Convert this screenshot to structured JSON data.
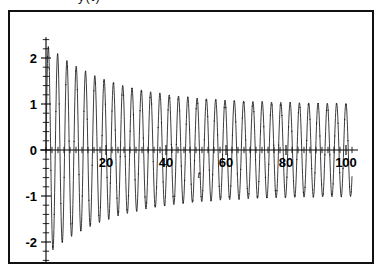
{
  "figure": {
    "top_caption": "y(t)",
    "background_color": "#ffffff",
    "frame_color": "#111111",
    "curve_color": "#1a1a1a"
  },
  "chart_data": {
    "type": "line",
    "title": "",
    "subtitle": "",
    "xlabel": "t",
    "ylabel": "",
    "xlim": [
      -2,
      104
    ],
    "ylim": [
      -2.45,
      2.45
    ],
    "grid": false,
    "legend": null,
    "x_ticks": [
      20,
      40,
      60,
      80,
      100
    ],
    "x_tick_labels": [
      "20",
      "40",
      "60",
      "80",
      "100"
    ],
    "x_minor_tick_step": 2,
    "y_ticks": [
      2,
      1,
      0,
      -1,
      -2
    ],
    "y_tick_labels": [
      "2",
      "1",
      "0",
      "-1",
      "-2"
    ],
    "y_minor_tick_step": 0.2,
    "marker": "point",
    "series": [
      {
        "name": "y",
        "description": "damped oscillation decaying from amplitude 2.3 toward steady amplitude 1.0",
        "envelope_initial_amplitude": 2.3,
        "envelope_final_amplitude": 1.0,
        "envelope_decay_constant": 22,
        "period": 3.1,
        "phase": 0,
        "x_start": 0,
        "x_end": 102,
        "sample_step": 0.08
      }
    ]
  }
}
